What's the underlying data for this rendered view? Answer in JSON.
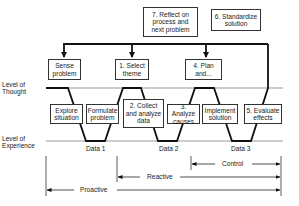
{
  "diagram": {
    "levels": {
      "thought": "Level of\nThought",
      "experience": "Level of\nExperience"
    },
    "top_boxes": [
      {
        "id": "reflect",
        "label": "7. Reflect on\nprocess and\nnext problem"
      },
      {
        "id": "standardize",
        "label": "6. Standardize\nsolution"
      }
    ],
    "thought_boxes": [
      {
        "id": "sense",
        "label": "Sense\nproblem"
      },
      {
        "id": "select",
        "label": "1. Select\ntheme"
      },
      {
        "id": "plan",
        "label": "4. Plan\nand..."
      }
    ],
    "middle_boxes": [
      {
        "id": "explore",
        "label": "Explore\nsituation"
      },
      {
        "id": "formulate",
        "label": "Formulate\nproblem"
      },
      {
        "id": "collect",
        "label": "2. Collect\nand analyze\ndata"
      },
      {
        "id": "analyze",
        "label": "3. Analyze\ncauses"
      },
      {
        "id": "implement",
        "label": "Implement\nsolution"
      },
      {
        "id": "evaluate",
        "label": "5. Evaluate\neffects"
      }
    ],
    "data_labels": [
      "Data 1",
      "Data 2",
      "Data 3"
    ],
    "ranges": [
      {
        "id": "control",
        "label": "Control"
      },
      {
        "id": "reactive",
        "label": "Reactive"
      },
      {
        "id": "proactive",
        "label": "Proactive"
      }
    ],
    "colors": {
      "line": "#111111",
      "thin_line": "#888888",
      "box_border": "#333333"
    }
  }
}
